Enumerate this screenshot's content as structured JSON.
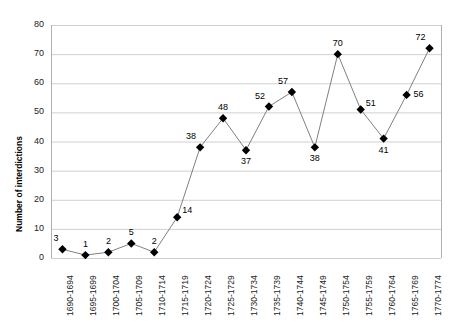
{
  "chart_data": {
    "type": "line",
    "title": "",
    "xlabel": "",
    "ylabel": "Number of interdictions",
    "ylim": [
      0,
      80
    ],
    "yticks": [
      0,
      10,
      20,
      30,
      40,
      50,
      60,
      70,
      80
    ],
    "grid": true,
    "legend": "none",
    "categories": [
      "1690-1694",
      "1695-1699",
      "1700-1704",
      "1705-1709",
      "1710-1714",
      "1715-1719",
      "1720-1724",
      "1725-1729",
      "1730-1734",
      "1735-1739",
      "1740-1744",
      "1745-1749",
      "1750-1754",
      "1755-1759",
      "1760-1764",
      "1765-1769",
      "1770-1774"
    ],
    "values": [
      3,
      1,
      2,
      5,
      2,
      14,
      38,
      48,
      37,
      52,
      57,
      38,
      70,
      51,
      41,
      56,
      72
    ],
    "point_labels": [
      "3",
      "1",
      "2",
      "5",
      "2",
      "14",
      "38",
      "48",
      "37",
      "52",
      "57",
      "38",
      "70",
      "51",
      "41",
      "56",
      "72"
    ],
    "label_positions": [
      "above-left",
      "above",
      "above",
      "above",
      "above",
      "above-right",
      "above-left",
      "above",
      "below",
      "above-left",
      "above-left",
      "below",
      "above",
      "above-right",
      "below",
      "right",
      "above-left"
    ],
    "series_name": "Number of interdictions",
    "colors": {
      "line": "#808080",
      "marker": "#000000",
      "grid": "#d0d0d0",
      "axis": "#b0b0b0",
      "text": "#222222",
      "background": "#ffffff"
    }
  }
}
